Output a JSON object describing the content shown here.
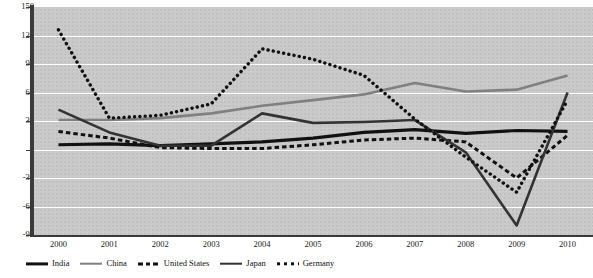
{
  "chart_data": {
    "type": "line",
    "title": "",
    "xlabel": "",
    "ylabel": "",
    "x": [
      "2000",
      "2001",
      "2002",
      "2003",
      "2004",
      "2005",
      "2006",
      "2007",
      "2008",
      "2009",
      "2010"
    ],
    "categories": [
      "2000",
      "2001",
      "2002",
      "2003",
      "2004",
      "2005",
      "2006",
      "2007",
      "2008",
      "2009",
      "2010"
    ],
    "ylim": [
      -90,
      150
    ],
    "yticks": [
      150,
      120,
      90,
      60,
      30,
      0,
      -30,
      -60,
      -90
    ],
    "grid": true,
    "legend_position": "bottom",
    "plot_background": "#c9c9c9",
    "gridline_color": "#ffffff",
    "series": [
      {
        "name": "India",
        "color": "#111111",
        "style": "solid-thick",
        "values": [
          5,
          6,
          4,
          6,
          8,
          12,
          18,
          21,
          17,
          20,
          19
        ]
      },
      {
        "name": "China",
        "color": "#808080",
        "style": "solid",
        "values": [
          31,
          31,
          33,
          38,
          46,
          52,
          58,
          70,
          61,
          63,
          78
        ]
      },
      {
        "name": "United States",
        "color": "#111111",
        "style": "dashed",
        "values": [
          19,
          12,
          2,
          1,
          1,
          5,
          10,
          12,
          8,
          -30,
          15
        ]
      },
      {
        "name": "Japan",
        "color": "#333333",
        "style": "solid",
        "values": [
          42,
          18,
          4,
          4,
          38,
          28,
          29,
          31,
          -3,
          -80,
          60
        ]
      },
      {
        "name": "Germany",
        "color": "#111111",
        "style": "dotted",
        "values": [
          126,
          33,
          36,
          48,
          106,
          95,
          78,
          32,
          -8,
          -45,
          52
        ]
      }
    ]
  },
  "axes": {
    "y_tick_labels": [
      "150",
      "120",
      "90",
      "60",
      "30",
      "0",
      "-30",
      "-60",
      "-90"
    ],
    "x_tick_labels": [
      "2000",
      "2001",
      "2002",
      "2003",
      "2004",
      "2005",
      "2006",
      "2007",
      "2008",
      "2009",
      "2010"
    ]
  },
  "legend": {
    "items": [
      {
        "label": "India",
        "swatch": "solid-thick-black"
      },
      {
        "label": "China",
        "swatch": "solid-gray"
      },
      {
        "label": "United States",
        "swatch": "dashed-black"
      },
      {
        "label": "Japan",
        "swatch": "solid-dark"
      },
      {
        "label": "Germany",
        "swatch": "dotted-black"
      }
    ]
  }
}
